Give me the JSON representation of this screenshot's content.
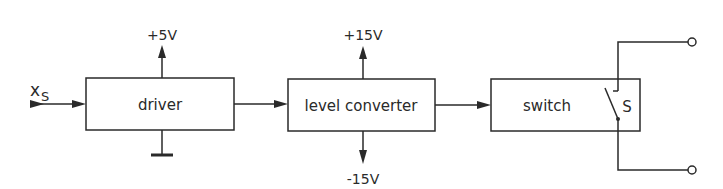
{
  "diagram": {
    "type": "block-diagram",
    "input": {
      "label": "x",
      "subscript": "S"
    },
    "blocks": [
      {
        "id": "driver",
        "label": "driver",
        "supply_top": "+5V",
        "bottom": "ground"
      },
      {
        "id": "level-converter",
        "label": "level converter",
        "supply_top": "+15V",
        "supply_bottom": "-15V"
      },
      {
        "id": "switch",
        "label": "switch",
        "contact_label": "S"
      }
    ],
    "output_terminals": 2,
    "colors": {
      "line": "#2a2a2a",
      "background": "#ffffff"
    }
  }
}
